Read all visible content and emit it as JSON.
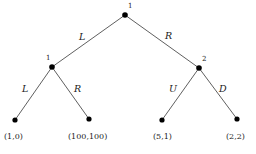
{
  "figure": {
    "type": "extensive-form-game-tree",
    "background_color": "#ffffff",
    "line_color": "#4d4d4d",
    "node_color": "#000000",
    "text_color": "#1a1a1a"
  },
  "nodes": [
    {
      "id": "root",
      "label": "1",
      "x": 125,
      "y": 15,
      "label_x": 128,
      "label_y": 3,
      "kind": "decision"
    },
    {
      "id": "left-player",
      "label": "1",
      "x": 52,
      "y": 67,
      "label_x": 46,
      "label_y": 55,
      "kind": "decision"
    },
    {
      "id": "right-player",
      "label": "2",
      "x": 199,
      "y": 68,
      "label_x": 202,
      "label_y": 56,
      "kind": "decision"
    },
    {
      "id": "leaf-1",
      "label": "",
      "x": 15,
      "y": 120,
      "kind": "terminal"
    },
    {
      "id": "leaf-2",
      "label": "",
      "x": 89,
      "y": 119,
      "kind": "terminal"
    },
    {
      "id": "leaf-3",
      "label": "",
      "x": 162,
      "y": 120,
      "kind": "terminal"
    },
    {
      "id": "leaf-4",
      "label": "",
      "x": 237,
      "y": 119,
      "kind": "terminal"
    }
  ],
  "edges": [
    {
      "id": "root-left",
      "from": "root",
      "to": "left-player",
      "label": "L",
      "label_x": 79,
      "label_y": 32
    },
    {
      "id": "root-right",
      "from": "root",
      "to": "right-player",
      "label": "R",
      "label_x": 165,
      "label_y": 31
    },
    {
      "id": "left-L",
      "from": "left-player",
      "to": "leaf-1",
      "label": "L",
      "label_x": 22,
      "label_y": 84
    },
    {
      "id": "left-R",
      "from": "left-player",
      "to": "leaf-2",
      "label": "R",
      "label_x": 74,
      "label_y": 84
    },
    {
      "id": "right-U",
      "from": "right-player",
      "to": "leaf-3",
      "label": "U",
      "label_x": 169,
      "label_y": 84
    },
    {
      "id": "right-D",
      "from": "right-player",
      "to": "leaf-4",
      "label": "D",
      "label_x": 219,
      "label_y": 84
    }
  ],
  "payoffs": [
    {
      "id": "payoff-1",
      "text": "(1,0)",
      "x": 4,
      "y": 133
    },
    {
      "id": "payoff-2",
      "text": "(100,100)",
      "x": 68,
      "y": 133
    },
    {
      "id": "payoff-3",
      "text": "(5,1)",
      "x": 153,
      "y": 133
    },
    {
      "id": "payoff-4",
      "text": "(2,2)",
      "x": 226,
      "y": 133
    }
  ]
}
